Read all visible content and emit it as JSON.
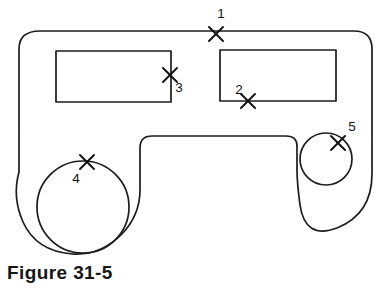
{
  "figure": {
    "caption": "Figure 31-5",
    "type": "engineering-part-outline-drawing",
    "background_color": "#ffffff",
    "line_color": "#1c1c1c",
    "text_color": "#111111"
  },
  "markers": [
    {
      "id": "marker-1",
      "label": "1",
      "label_x": 221,
      "label_y": 14,
      "x": 216,
      "y": 34,
      "size": 7,
      "located_on": "outer-outline-top-edge"
    },
    {
      "id": "marker-2",
      "label": "2",
      "label_x": 239,
      "label_y": 90,
      "x": 248,
      "y": 101,
      "size": 7,
      "located_on": "right-rectangle-bottom-edge"
    },
    {
      "id": "marker-3",
      "label": "3",
      "label_x": 179,
      "label_y": 88,
      "x": 170,
      "y": 75,
      "size": 7,
      "located_on": "left-rectangle-right-edge"
    },
    {
      "id": "marker-4",
      "label": "4",
      "label_x": 76,
      "label_y": 179,
      "x": 87,
      "y": 162,
      "size": 7,
      "located_on": "large-circle-top-edge"
    },
    {
      "id": "marker-5",
      "label": "5",
      "label_x": 352,
      "label_y": 127,
      "x": 338,
      "y": 143,
      "size": 7,
      "located_on": "small-circle-upper-right-edge"
    }
  ],
  "shapes": {
    "outer_outline": {
      "name": "part-outline",
      "path": "M 40 31 L 354 31 Q 372 31 372 49 L 372 174 Q 372 214 337 228 Q 305 240 300 205 Q 297 182 297 170 L 297 146 Q 297 136 286 136 L 152 136 Q 140 136 140 148 L 140 190 Q 140 215 122 234 Q 100 256 72 254 Q 36 251 23 222 Q 12 197 19 172 L 19 49 Q 19 31 40 31 Z"
    },
    "left_rectangle": {
      "name": "left-rectangular-cutout",
      "x": 56,
      "y": 51,
      "width": 115,
      "height": 51
    },
    "right_rectangle": {
      "name": "right-rectangular-cutout",
      "x": 220,
      "y": 50,
      "width": 116,
      "height": 51
    },
    "large_circle": {
      "name": "large-circular-hole",
      "cx": 83,
      "cy": 207,
      "r": 46
    },
    "small_circle": {
      "name": "small-circular-hole",
      "cx": 326,
      "cy": 159,
      "r": 26
    }
  }
}
